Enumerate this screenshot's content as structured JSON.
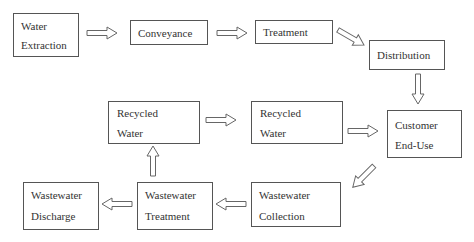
{
  "diagram": {
    "type": "flowchart",
    "nodes": [
      {
        "id": "water_extraction",
        "lines": [
          "Water",
          "Extraction"
        ]
      },
      {
        "id": "conveyance",
        "lines": [
          "Conveyance"
        ]
      },
      {
        "id": "treatment",
        "lines": [
          "Treatment"
        ]
      },
      {
        "id": "distribution",
        "lines": [
          "Distribution"
        ]
      },
      {
        "id": "customer_end_use",
        "lines": [
          "Customer",
          "End-Use"
        ]
      },
      {
        "id": "recycled_water_right",
        "lines": [
          "Recycled",
          "Water"
        ]
      },
      {
        "id": "recycled_water_left",
        "lines": [
          "Recycled",
          "Water"
        ]
      },
      {
        "id": "wastewater_collection",
        "lines": [
          "Wastewater",
          "Collection"
        ]
      },
      {
        "id": "wastewater_treatment",
        "lines": [
          "Wastewater",
          "Treatment"
        ]
      },
      {
        "id": "wastewater_discharge",
        "lines": [
          "Wastewater",
          "Discharge"
        ]
      }
    ],
    "edges": [
      {
        "from": "water_extraction",
        "to": "conveyance"
      },
      {
        "from": "conveyance",
        "to": "treatment"
      },
      {
        "from": "treatment",
        "to": "distribution"
      },
      {
        "from": "distribution",
        "to": "customer_end_use"
      },
      {
        "from": "customer_end_use",
        "to": "wastewater_collection"
      },
      {
        "from": "wastewater_collection",
        "to": "wastewater_treatment"
      },
      {
        "from": "wastewater_treatment",
        "to": "wastewater_discharge"
      },
      {
        "from": "wastewater_treatment",
        "to": "recycled_water_left"
      },
      {
        "from": "recycled_water_left",
        "to": "recycled_water_right"
      },
      {
        "from": "recycled_water_right",
        "to": "customer_end_use"
      }
    ]
  },
  "colors": {
    "stroke": "#555555",
    "text": "#333333",
    "background": "#ffffff"
  }
}
